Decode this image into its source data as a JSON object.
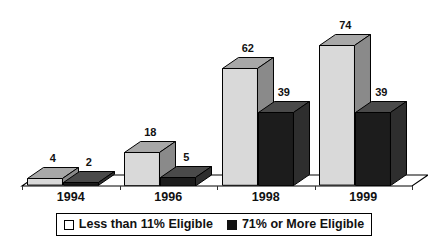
{
  "chart_data": {
    "type": "bar",
    "title": "",
    "subtitle": "",
    "xlabel": "",
    "ylabel": "",
    "grid": false,
    "legend_position": "bottom",
    "style": "3d-grouped-bar",
    "categories": [
      "1994",
      "1996",
      "1998",
      "1999"
    ],
    "ylim": [
      0,
      80
    ],
    "series": [
      {
        "name": "Less than 11% Eligible",
        "swatch": "light",
        "color": "#D9D9D9",
        "values": [
          4,
          18,
          62,
          74
        ],
        "value_labels": [
          "4",
          "18",
          "62",
          "74"
        ]
      },
      {
        "name": "71% or More Eligible",
        "swatch": "dark",
        "color": "#1C1C1C",
        "values": [
          2,
          5,
          39,
          39
        ],
        "value_labels": [
          "2",
          "5",
          "39",
          "39"
        ]
      }
    ]
  },
  "legend": {
    "entries": [
      {
        "label": "Less than 11% Eligible",
        "swatch": "light"
      },
      {
        "label": "71% or More Eligible",
        "swatch": "dark"
      }
    ]
  },
  "axis": {
    "tick_labels": [
      "1994",
      "1996",
      "1998",
      "1999"
    ]
  },
  "colors": {
    "light_bar_front": "#D9D9D9",
    "light_bar_top": "#A8A8A8",
    "light_bar_side": "#8A8A8A",
    "dark_bar_front": "#1C1C1C",
    "dark_bar_top": "#4A4A4A",
    "dark_bar_side": "#2E2E2E",
    "floor": "#FFFFFF",
    "outline": "#000000",
    "text": "#111111"
  }
}
